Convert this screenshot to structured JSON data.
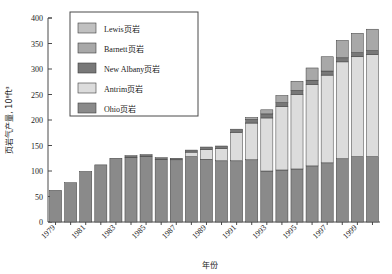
{
  "chart_data": {
    "type": "bar",
    "stacked": true,
    "title": "",
    "xlabel": "年份",
    "ylabel": "页岩气产量, 10⁸ft³",
    "ylim": [
      0,
      400
    ],
    "yticks": [
      0,
      50,
      100,
      150,
      200,
      250,
      300,
      350,
      400
    ],
    "ytick_labels": [
      "0",
      "50",
      "100",
      "150",
      "200",
      "250",
      "300",
      "350",
      "400"
    ],
    "grid": false,
    "legend_position": "top-center",
    "categories": [
      "1979",
      "1980",
      "1981",
      "1982",
      "1983",
      "1984",
      "1985",
      "1986",
      "1987",
      "1988",
      "1989",
      "1990",
      "1991",
      "1992",
      "1993",
      "1994",
      "1995",
      "1996",
      "1997",
      "1998",
      "1999",
      "2000"
    ],
    "xtick_labels": [
      "1979",
      "1981",
      "1983",
      "1985",
      "1987",
      "1989",
      "1991",
      "1993",
      "1995",
      "1997",
      "1999"
    ],
    "series": [
      {
        "name": "Ohio页岩",
        "color": "#8a8a8a",
        "values": [
          62,
          77,
          99,
          112,
          125,
          127,
          129,
          123,
          122,
          128,
          123,
          120,
          120,
          122,
          100,
          102,
          104,
          110,
          116,
          124,
          128,
          128
        ]
      },
      {
        "name": "Antrim页岩",
        "color": "#dcdcdc",
        "values": [
          0,
          0,
          0,
          0,
          0,
          0,
          0,
          0,
          0,
          9,
          19,
          24,
          56,
          72,
          104,
          124,
          146,
          160,
          172,
          190,
          196,
          200
        ]
      },
      {
        "name": "New Albany页岩",
        "color": "#787878",
        "values": [
          0,
          0,
          0,
          0,
          0,
          3,
          3,
          3,
          3,
          4,
          5,
          5,
          6,
          7,
          8,
          8,
          8,
          8,
          8,
          8,
          8,
          8
        ]
      },
      {
        "name": "Barnett页岩",
        "color": "#a8a8a8",
        "values": [
          0,
          0,
          0,
          0,
          0,
          0,
          0,
          0,
          0,
          0,
          0,
          0,
          0,
          4,
          8,
          14,
          18,
          24,
          28,
          34,
          38,
          42
        ]
      },
      {
        "name": "Lewis页岩",
        "color": "#c0c0c0",
        "values": [
          0,
          0,
          0,
          0,
          0,
          0,
          0,
          0,
          0,
          0,
          0,
          0,
          0,
          0,
          0,
          0,
          0,
          0,
          0,
          0,
          0,
          0
        ]
      }
    ]
  },
  "legend": {
    "items": [
      {
        "label": "Lewis页岩",
        "color": "#c0c0c0"
      },
      {
        "label": "Barnett页岩",
        "color": "#a8a8a8"
      },
      {
        "label": "New Albany页岩",
        "color": "#787878"
      },
      {
        "label": "Antrim页岩",
        "color": "#dcdcdc"
      },
      {
        "label": "Ohio页岩",
        "color": "#8a8a8a"
      }
    ]
  },
  "axes": {
    "y_title": "页岩气产量, 10⁸ft³",
    "x_title": "年份"
  }
}
